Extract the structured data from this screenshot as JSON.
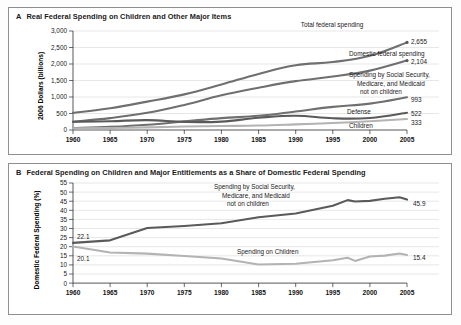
{
  "figure": {
    "panels": [
      {
        "letter": "A",
        "title": "Real Federal Spending on Children and Other Major Items"
      },
      {
        "letter": "B",
        "title": "Federal Spending on Children and Major Entitlements as a Share of Domestic Federal Spending"
      }
    ]
  },
  "chart_data": [
    {
      "type": "line",
      "panel": "A",
      "title": "Real Federal Spending on Children and Other Major Items",
      "xlabel": "",
      "ylabel": "2006 Dollars (billions)",
      "xlim": [
        1960,
        2005
      ],
      "ylim": [
        0,
        3000
      ],
      "xticks": [
        "1960",
        "1965",
        "1970",
        "1975",
        "1980",
        "1985",
        "1990",
        "1995",
        "2000",
        "2005"
      ],
      "yticks": [
        "0",
        "500",
        "1,000",
        "1,500",
        "2,000",
        "2,500",
        "3,000"
      ],
      "grid": true,
      "legend_position": "inline-annotations",
      "x": [
        1960,
        1965,
        1970,
        1975,
        1980,
        1985,
        1990,
        1995,
        2000,
        2005
      ],
      "series": [
        {
          "name": "Total federal spending",
          "color": "#6f6f6f",
          "end_label": "2,655",
          "values": [
            520,
            660,
            860,
            1080,
            1380,
            1700,
            1960,
            2060,
            2250,
            2655
          ]
        },
        {
          "name": "Domestic federal spending",
          "color": "#6f6f6f",
          "end_label": "2,104",
          "values": [
            250,
            360,
            520,
            760,
            1050,
            1280,
            1480,
            1620,
            1800,
            2104
          ]
        },
        {
          "name": "Spending by Social Security, Medicare, and Medicaid not on children",
          "color": "#6f6f6f",
          "end_label": "993",
          "values": [
            55,
            95,
            160,
            260,
            360,
            430,
            560,
            700,
            800,
            993
          ]
        },
        {
          "name": "Defense",
          "color": "#5a5a5a",
          "end_label": "522",
          "values": [
            250,
            265,
            300,
            245,
            255,
            370,
            430,
            355,
            365,
            522
          ]
        },
        {
          "name": "Children",
          "color": "#b3b3b3",
          "end_label": "333",
          "values": [
            50,
            62,
            80,
            105,
            120,
            135,
            170,
            210,
            265,
            333
          ]
        }
      ],
      "annotations": [
        "Total federal spending",
        "Domestic federal spending",
        "Spending by Social Security,",
        "Medicare, and Medicaid",
        "not on children",
        "Defense",
        "Children"
      ]
    },
    {
      "type": "line",
      "panel": "B",
      "title": "Federal Spending on Children and Major Entitlements as a Share of Domestic Federal Spending",
      "xlabel": "",
      "ylabel": "Domestic Federal Spending (%)",
      "xlim": [
        1960,
        2005
      ],
      "ylim": [
        0,
        55
      ],
      "xticks": [
        "1960",
        "1965",
        "1970",
        "1975",
        "1980",
        "1985",
        "1990",
        "1995",
        "2000",
        "2005"
      ],
      "yticks": [
        "0",
        "5",
        "10",
        "15",
        "20",
        "25",
        "30",
        "35",
        "40",
        "45",
        "50",
        "55"
      ],
      "grid": true,
      "legend_position": "inline-annotations",
      "x": [
        1960,
        1965,
        1970,
        1975,
        1980,
        1985,
        1990,
        1995,
        1997,
        1998,
        2000,
        2002,
        2004,
        2005
      ],
      "series": [
        {
          "name": "Spending by Social Security, Medicare, and Medicaid not on children",
          "color": "#5a5a5a",
          "start_label": "22.1",
          "end_label": "45.9",
          "values": [
            22.1,
            23.5,
            30.3,
            31.4,
            32.9,
            36.2,
            38.2,
            42.5,
            45.6,
            44.8,
            45.2,
            46.3,
            47.2,
            45.9
          ]
        },
        {
          "name": "Spending on Children",
          "color": "#b3b3b3",
          "start_label": "20.1",
          "end_label": "15.4",
          "values": [
            20.1,
            16.8,
            16.2,
            14.9,
            13.5,
            10.2,
            10.6,
            12.6,
            13.9,
            12.2,
            14.6,
            15.1,
            16.3,
            15.4
          ]
        }
      ],
      "annotations": [
        "Spending by Social Security,",
        "Medicare, and Medicaid",
        "not on children",
        "Spending on Children"
      ]
    }
  ]
}
